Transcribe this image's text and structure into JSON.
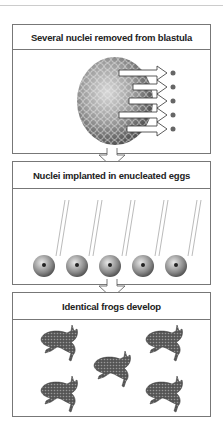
{
  "panels": [
    {
      "title": "Several nuclei removed from blastula",
      "nucleus_count": 5
    },
    {
      "title": "Nuclei implanted in enucleated eggs",
      "egg_count": 5
    },
    {
      "title": "Identical frogs develop",
      "frog_count": 5
    }
  ],
  "colors": {
    "border": "#777777",
    "title_text": "#222222"
  }
}
